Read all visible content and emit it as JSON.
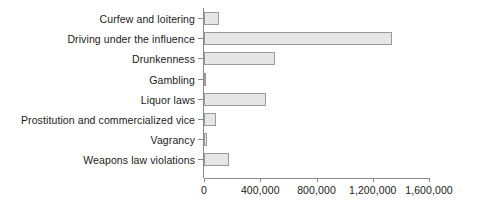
{
  "chart_data": {
    "type": "bar",
    "orientation": "horizontal",
    "title": "",
    "subtitle": "",
    "xlabel": "",
    "ylabel": "",
    "grid": false,
    "legend": null,
    "xlim": [
      0,
      1600000
    ],
    "xticks": [
      0,
      400000,
      800000,
      1200000,
      1600000
    ],
    "xtick_labels": [
      "0",
      "400,000",
      "800,000",
      "1,200,000",
      "1,600,000"
    ],
    "categories": [
      "Curfew and loitering",
      "Driving under the influence",
      "Drunkenness",
      "Gambling",
      "Liquor laws",
      "Prostitution and commercialized vice",
      "Vagrancy",
      "Weapons law violations"
    ],
    "values": [
      107000,
      1337000,
      505000,
      9000,
      441000,
      85000,
      20000,
      178000
    ],
    "bar_fill_color": "#e6e6e6",
    "bar_border_color": "#9a9a9a",
    "axis_color": "#8a8a8a",
    "text_color": "#1a1a1a"
  }
}
